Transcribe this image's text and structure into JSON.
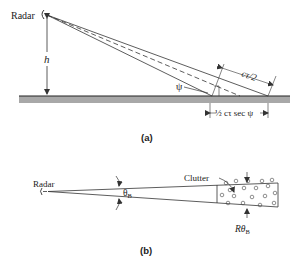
{
  "figure": {
    "part_a": {
      "caption": "(a)",
      "radar_label": "Radar",
      "height_label": "h",
      "grazing_angle_label": "ψ",
      "range_resolution_label": "cτ/2",
      "footprint_label": "½ cτ sec ψ"
    },
    "part_b": {
      "caption": "(b)",
      "radar_label": "Radar",
      "beamwidth_label": "θ",
      "beamwidth_subscript": "B",
      "clutter_label": "Clutter",
      "cross_range_label": "Rθ",
      "cross_range_subscript": "B"
    },
    "colors": {
      "line": "#333333",
      "ground_fill": "#a8a8a8",
      "ground_edge": "#222222"
    }
  }
}
